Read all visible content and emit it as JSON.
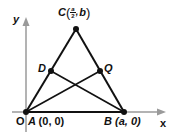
{
  "diagram": {
    "type": "coordinate-geometry-triangle",
    "axes": {
      "x_label": "x",
      "y_label": "y",
      "origin_label": "O",
      "axis_color": "#9a9a9a"
    },
    "line_color": "#111111",
    "points": {
      "A": {
        "name": "A",
        "coords": "(0, 0)"
      },
      "B": {
        "name": "B",
        "coords": "(a, 0)"
      },
      "C": {
        "name": "C",
        "coord_x_num": "a",
        "coord_x_den": "2",
        "coord_sep": ",",
        "coord_y": "b"
      },
      "D": {
        "name": "D"
      },
      "Q": {
        "name": "Q"
      }
    },
    "segments": [
      "AB",
      "AC",
      "BC",
      "AQ",
      "BD"
    ]
  }
}
